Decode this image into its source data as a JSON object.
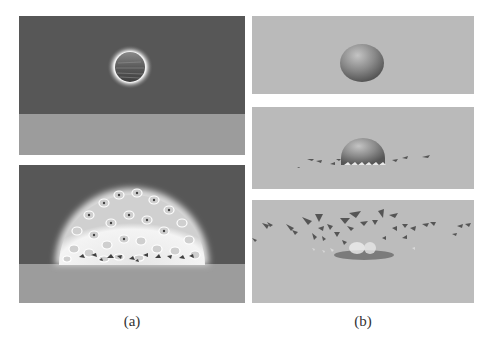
{
  "figure": {
    "subfigures": [
      {
        "label": "(a)",
        "description": "Volumetric/glow rendering: sphere falling then shattering into glowing fragments",
        "panels": [
          {
            "id": "a1",
            "content": "glowing textured sphere above ground",
            "sky_color": "#575757",
            "ground_color": "#9a9a9a"
          },
          {
            "id": "a2",
            "content": "dome of glowing fragments on ground",
            "sky_color": "#575757",
            "ground_color": "#9a9a9a"
          }
        ]
      },
      {
        "label": "(b)",
        "description": "Shaded surface rendering: sphere falling, impacting, and fracturing into shards",
        "panels": [
          {
            "id": "b1",
            "content": "smooth shaded sphere in air",
            "background_color": "#b9b9b9"
          },
          {
            "id": "b2",
            "content": "sphere hitting ground with small debris",
            "background_color": "#b9b9b9"
          },
          {
            "id": "b3",
            "content": "shards scattered outward in arc",
            "background_color": "#b9b9b9"
          }
        ]
      }
    ]
  }
}
